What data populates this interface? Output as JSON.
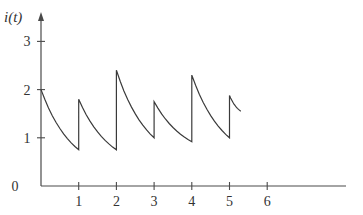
{
  "chart_data": {
    "type": "line",
    "title": "",
    "xlabel": "",
    "ylabel": "i(t)",
    "xlim": [
      0,
      7.9
    ],
    "ylim": [
      0,
      3.6
    ],
    "x_ticks": [
      1,
      2,
      3,
      4,
      5,
      6
    ],
    "y_ticks": [
      0,
      1,
      2,
      3
    ],
    "x_tick_labels": [
      "1",
      "2",
      "3",
      "4",
      "5",
      "6"
    ],
    "y_tick_labels": [
      "0",
      "1",
      "2",
      "3"
    ],
    "grid": false,
    "legend": null,
    "series": [
      {
        "name": "i(t)",
        "description": "Sawtooth-like decaying current with jumps at integer t",
        "points": [
          [
            0,
            2.0
          ],
          [
            1,
            0.75
          ],
          [
            1,
            1.8
          ],
          [
            2,
            0.75
          ],
          [
            2,
            2.4
          ],
          [
            3,
            1.0
          ],
          [
            3,
            1.75
          ],
          [
            4,
            0.92
          ],
          [
            4,
            2.3
          ],
          [
            5,
            1.0
          ],
          [
            5,
            1.88
          ],
          [
            5.3,
            1.55
          ]
        ]
      }
    ]
  },
  "layout": {
    "origin_px": [
      41,
      186
    ],
    "x_unit_px": 37.7,
    "y_unit_px": 48.2,
    "x_axis_end_px": 346,
    "y_axis_top_px": 12
  }
}
